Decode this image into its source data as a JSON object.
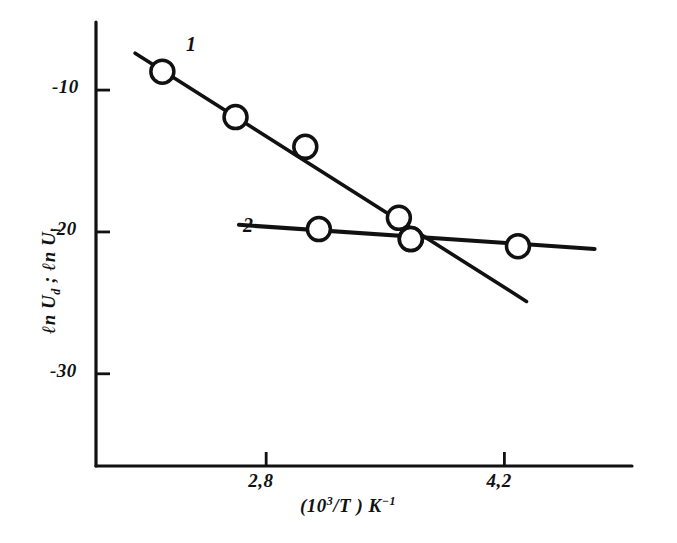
{
  "figure": {
    "background_color": "#ffffff",
    "ink_color": "#111111"
  },
  "axes": {
    "y_title": "ℓn U",
    "y_title_sub_1": "d",
    "y_title_mid": " ; ℓn U",
    "y_title_sub_2": "i",
    "x_title_prefix": "(10",
    "x_title_sup": "3",
    "x_title_mid": "/T ) K",
    "x_title_sup2": "−1",
    "y_ticks": [
      {
        "label": "-10",
        "value": -10
      },
      {
        "label": "-20",
        "value": -20
      },
      {
        "label": "-30",
        "value": -30
      }
    ],
    "x_ticks": [
      {
        "label": "2,8",
        "value": 2.8
      },
      {
        "label": "4,2",
        "value": 4.2
      }
    ],
    "x_range": [
      1.8,
      4.95
    ],
    "y_range": [
      -36.5,
      -5.2
    ]
  },
  "curves": [
    {
      "id": "1",
      "label": "1"
    },
    {
      "id": "2",
      "label": "2"
    }
  ],
  "chart_data": {
    "type": "scatter",
    "title": "",
    "xlabel": "(10^3/T) K^-1",
    "ylabel": "ln U_d ; ln U_i",
    "xlim": [
      1.8,
      4.95
    ],
    "ylim": [
      -36.5,
      -5.2
    ],
    "grid": false,
    "legend": "inline-curve-numbers",
    "marker": "open-circle",
    "xticks": [
      2.8,
      4.2
    ],
    "yticks": [
      -10,
      -20,
      -30
    ],
    "series": [
      {
        "name": "1",
        "label": "1",
        "fit_line": {
          "x": [
            2.03,
            4.33
          ],
          "y": [
            -7.4,
            -24.9
          ]
        },
        "x": [
          2.19,
          2.62,
          3.03,
          3.58,
          3.65
        ],
        "y": [
          -8.7,
          -11.9,
          -14.0,
          -19.0,
          -20.5
        ]
      },
      {
        "name": "2",
        "label": "2",
        "fit_line": {
          "x": [
            2.64,
            4.73
          ],
          "y": [
            -19.5,
            -21.2
          ]
        },
        "x": [
          3.11,
          3.65,
          4.28
        ],
        "y": [
          -19.8,
          -20.5,
          -21.0
        ]
      }
    ]
  }
}
